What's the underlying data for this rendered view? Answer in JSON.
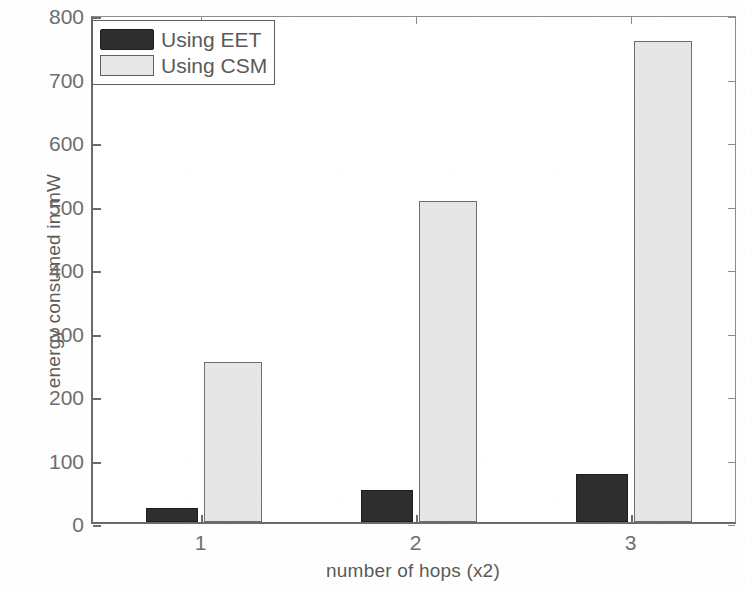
{
  "chart_data": {
    "type": "bar",
    "title": "",
    "xlabel": "number of hops (x2)",
    "ylabel": "energy consumed in mW",
    "categories": [
      "1",
      "2",
      "3"
    ],
    "series": [
      {
        "name": "Using EET",
        "values": [
          22,
          50,
          75
        ],
        "color": "#2e2e2e"
      },
      {
        "name": "Using CSM",
        "values": [
          252,
          505,
          758
        ],
        "color": "#e6e6e6"
      }
    ],
    "ylim": [
      0,
      800
    ],
    "yticks": [
      0,
      100,
      200,
      300,
      400,
      500,
      600,
      700,
      800
    ],
    "ytick_labels": [
      "0",
      "100",
      "200",
      "300",
      "400",
      "500",
      "600",
      "700",
      "800"
    ],
    "xticks": [
      "1",
      "2",
      "3"
    ],
    "grid": false,
    "legend_position": "top-left",
    "legend_entries": [
      "Using EET",
      "Using CSM"
    ]
  },
  "legend": {
    "entries": [
      {
        "label": "Using EET",
        "swatch": "dark-filled-swatch"
      },
      {
        "label": "Using CSM",
        "swatch": "light-filled-swatch"
      }
    ]
  },
  "axes": {
    "y_title": "energy consumed in mW",
    "x_title": "number of hops (x2)"
  }
}
